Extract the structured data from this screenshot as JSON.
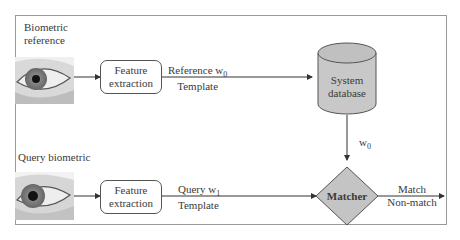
{
  "reference_path": {
    "title_line1": "Biometric",
    "title_line2": "reference",
    "image": "eye-image",
    "feature_box": {
      "line1": "Feature",
      "line2": "extraction"
    },
    "template_label": {
      "line1_prefix": "Reference w",
      "line1_sub": "0",
      "line2": "Template"
    }
  },
  "query_path": {
    "title": "Query biometric",
    "image": "eye-image",
    "feature_box": {
      "line1": "Feature",
      "line2": "extraction"
    },
    "template_label": {
      "line1_prefix": "Query w",
      "line1_sub": "1",
      "line2": "Template"
    }
  },
  "database": {
    "line1": "System",
    "line2": "database",
    "fill": "#c8c8c8"
  },
  "database_output": {
    "prefix": "w",
    "sub": "0"
  },
  "matcher": {
    "label": "Matcher",
    "fill": "#c4c4c4"
  },
  "result": {
    "line1": "Match",
    "line2": "Non-match"
  },
  "colors": {
    "border": "#9a9a9a",
    "lines": "#333333",
    "text": "#3a3a3a"
  }
}
